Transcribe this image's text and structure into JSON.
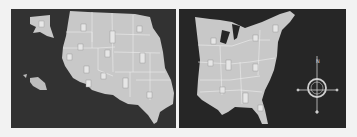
{
  "scene": {
    "description": "Photograph of a two-part United States map puzzle on dark boards",
    "panels": [
      {
        "name": "Western United States",
        "includes": [
          "Alaska",
          "Hawaii"
        ]
      },
      {
        "name": "Eastern United States"
      }
    ],
    "compass": {
      "label": "N"
    }
  },
  "colors": {
    "background": "#f2f2f2",
    "board": "#2b2b2b",
    "map": "#c8c8c8",
    "borders": "#e6e6e6"
  }
}
